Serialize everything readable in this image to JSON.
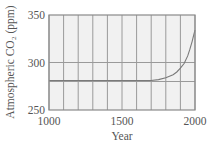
{
  "chart_data": {
    "type": "line",
    "title": "",
    "xlabel": "Year",
    "ylabel": "Atmospheric CO₂ (ppm)",
    "xlim": [
      1000,
      2000
    ],
    "ylim": [
      250,
      350
    ],
    "xticks": [
      1000,
      1500,
      2000
    ],
    "yticks": [
      250,
      300,
      350
    ],
    "x_gridlines": [
      1000,
      1050,
      1100,
      1150,
      1200,
      1250,
      1300,
      1350,
      1400,
      1450,
      1500,
      1550,
      1600,
      1650,
      1700,
      1750,
      1800,
      1850,
      1900,
      1950,
      2000
    ],
    "y_gridlines": [
      280,
      300
    ],
    "grid": true,
    "legend": null,
    "series": [
      {
        "name": "Atmospheric CO2",
        "x": [
          1000,
          1100,
          1200,
          1300,
          1400,
          1500,
          1600,
          1700,
          1750,
          1800,
          1850,
          1875,
          1900,
          1925,
          1950,
          1965,
          1980,
          1990,
          2000
        ],
        "values": [
          281,
          281,
          281,
          281,
          281,
          281,
          281,
          281,
          282,
          284,
          287,
          290,
          294,
          299,
          307,
          314,
          322,
          328,
          334
        ]
      }
    ],
    "colors": {
      "plot_background": "#f1f1f1",
      "gridline": "#9a9a9a",
      "frame": "#8a8a8a",
      "curve": "#7a7a7a",
      "text": "#555555"
    }
  }
}
